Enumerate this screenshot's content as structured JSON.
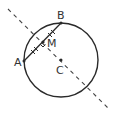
{
  "diagram": {
    "type": "geometry",
    "colors": {
      "stroke": "#2a2a2a",
      "dashed": "#444444",
      "text": "#333333",
      "background": "#ffffff"
    },
    "circle": {
      "cx": 61,
      "cy": 60,
      "r": 37
    },
    "points": {
      "A": {
        "label": "A",
        "x": 24,
        "y": 61
      },
      "B": {
        "label": "B",
        "x": 61,
        "y": 23
      },
      "M": {
        "label": "M",
        "x": 43,
        "y": 42
      },
      "C": {
        "label": "C",
        "x": 61,
        "y": 60
      }
    },
    "labels": {
      "A": "A",
      "B": "B",
      "M": "M",
      "C": "C"
    },
    "segments": [
      {
        "name": "chord-AB",
        "from": "A",
        "to": "B",
        "style": "solid"
      },
      {
        "name": "perpendicular-bisector",
        "from": [
          8,
          9
        ],
        "to": [
          108,
          108
        ],
        "style": "dashed"
      }
    ],
    "markers": {
      "right_angle_at": "M",
      "equal_tick_marks": [
        "AM",
        "MB"
      ]
    }
  }
}
